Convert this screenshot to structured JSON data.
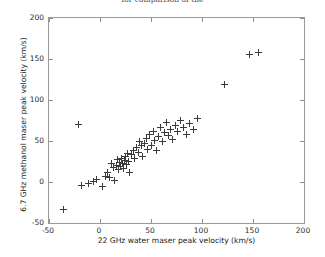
{
  "chart_data": {
    "type": "scatter",
    "title": "for comparison of the",
    "xlabel": "22 GHz water maser peak velocity (km/s)",
    "ylabel": "6.7 GHz methanol maser peak velocity (km/s)",
    "xlim": [
      -50,
      200
    ],
    "ylim": [
      -50,
      200
    ],
    "xticks": [
      -50,
      0,
      50,
      100,
      150,
      200
    ],
    "yticks": [
      -50,
      0,
      50,
      100,
      150,
      200
    ],
    "xticklabels": [
      "-50",
      "0",
      "50",
      "100",
      "150",
      "200"
    ],
    "yticklabels": [
      "-50",
      "0",
      "50",
      "100",
      "150",
      "200"
    ],
    "grid": false,
    "legend": null,
    "marker": "+",
    "marker_color": "#3b3b3b",
    "series": [
      {
        "name": "maser sources",
        "points": [
          [
            -36,
            -33
          ],
          [
            -21,
            70
          ],
          [
            -18,
            -4
          ],
          [
            -11,
            -2
          ],
          [
            -6,
            1
          ],
          [
            -3,
            3
          ],
          [
            2,
            -6
          ],
          [
            5,
            7
          ],
          [
            7,
            12
          ],
          [
            9,
            6
          ],
          [
            11,
            22
          ],
          [
            13,
            18
          ],
          [
            14,
            2
          ],
          [
            16,
            20
          ],
          [
            17,
            27
          ],
          [
            18,
            15
          ],
          [
            19,
            24
          ],
          [
            20,
            19
          ],
          [
            21,
            29
          ],
          [
            22,
            23
          ],
          [
            23,
            17
          ],
          [
            24,
            26
          ],
          [
            25,
            31
          ],
          [
            26,
            21
          ],
          [
            27,
            35
          ],
          [
            28,
            25
          ],
          [
            29,
            12
          ],
          [
            31,
            33
          ],
          [
            33,
            38
          ],
          [
            34,
            29
          ],
          [
            36,
            42
          ],
          [
            38,
            36
          ],
          [
            39,
            50
          ],
          [
            41,
            44
          ],
          [
            42,
            31
          ],
          [
            44,
            47
          ],
          [
            46,
            53
          ],
          [
            47,
            40
          ],
          [
            49,
            58
          ],
          [
            50,
            45
          ],
          [
            52,
            62
          ],
          [
            53,
            51
          ],
          [
            55,
            38
          ],
          [
            57,
            55
          ],
          [
            59,
            66
          ],
          [
            61,
            49
          ],
          [
            63,
            60
          ],
          [
            65,
            72
          ],
          [
            67,
            57
          ],
          [
            69,
            64
          ],
          [
            71,
            52
          ],
          [
            74,
            69
          ],
          [
            76,
            61
          ],
          [
            79,
            75
          ],
          [
            82,
            66
          ],
          [
            85,
            58
          ],
          [
            88,
            71
          ],
          [
            92,
            64
          ],
          [
            96,
            78
          ],
          [
            122,
            119
          ],
          [
            147,
            155
          ],
          [
            155,
            158
          ]
        ]
      }
    ]
  },
  "axis": {
    "x_tick_labels": [
      "-50",
      "0",
      "50",
      "100",
      "150",
      "200"
    ],
    "y_tick_labels": [
      "-50",
      "0",
      "50",
      "100",
      "150",
      "200"
    ]
  }
}
